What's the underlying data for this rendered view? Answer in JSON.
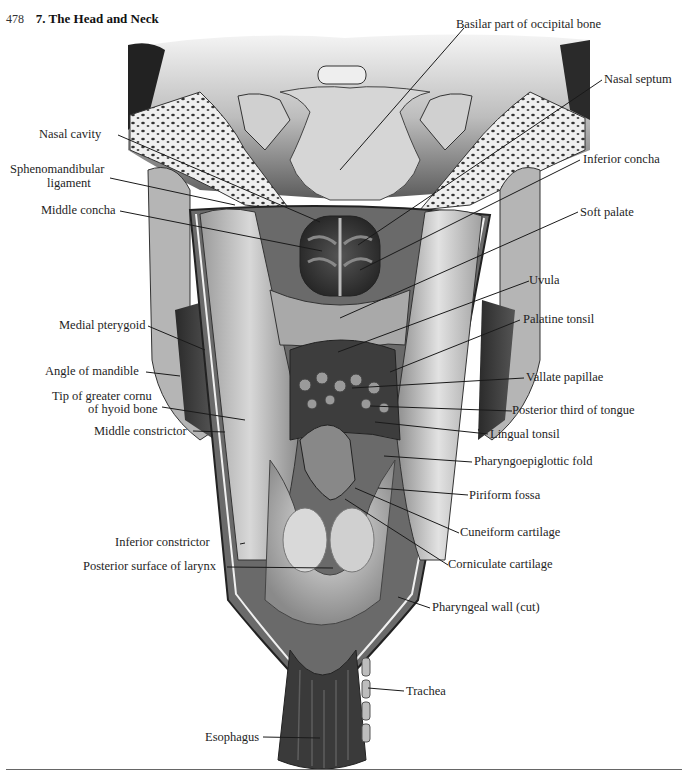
{
  "header": {
    "page_number": "478",
    "chapter_title": "7. The Head and Neck"
  },
  "figure": {
    "labels": {
      "basilar_part": "Basilar part of occipital bone",
      "nasal_septum": "Nasal septum",
      "nasal_cavity": "Nasal cavity",
      "inferior_concha": "Inferior concha",
      "sphenomandibular_1": "Sphenomandibular",
      "sphenomandibular_2": "ligament",
      "middle_concha": "Middle concha",
      "soft_palate": "Soft palate",
      "uvula": "Uvula",
      "medial_pterygoid": "Medial pterygoid",
      "palatine_tonsil": "Palatine tonsil",
      "angle_of_mandible": "Angle of mandible",
      "vallate_papillae": "Vallate papillae",
      "tip_greater_cornu_1": "Tip of greater cornu",
      "tip_greater_cornu_2": "of hyoid bone",
      "posterior_third_tongue": "Posterior third of tongue",
      "middle_constrictor": "Middle constrictor",
      "lingual_tonsil": "Lingual tonsil",
      "pharyngoepiglottic_fold": "Pharyngoepiglottic fold",
      "piriform_fossa": "Piriform fossa",
      "cuneiform_cartilage": "Cuneiform cartilage",
      "inferior_constrictor": "Inferior constrictor",
      "corniculate_cartilage": "Corniculate cartilage",
      "posterior_surface_larynx": "Posterior surface of larynx",
      "pharyngeal_wall_cut": "Pharyngeal wall (cut)",
      "trachea": "Trachea",
      "esophagus": "Esophagus"
    }
  },
  "colors": {
    "ink": "#1e1e1e",
    "dark_tissue": "#2b2b2b",
    "mid_tissue": "#7a7a7a",
    "light_tissue": "#c9c9c9",
    "bone": "#e6e6e6",
    "paper": "#ffffff"
  }
}
